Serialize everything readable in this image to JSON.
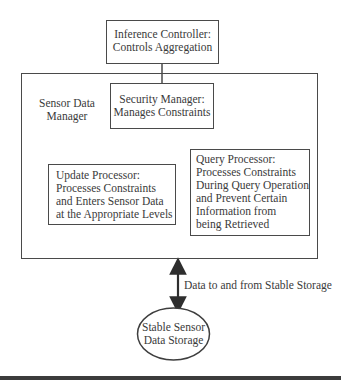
{
  "diagram": {
    "inference_controller": {
      "line1": "Inference Controller:",
      "line2": "Controls Aggregation"
    },
    "sensor_data_manager": {
      "line1": "Sensor Data",
      "line2": "Manager"
    },
    "security_manager": {
      "line1": "Security Manager:",
      "line2": "Manages Constraints"
    },
    "update_processor": {
      "lines": [
        "Update Processor:",
        "Processes Constraints",
        "and Enters Sensor Data",
        "at the Appropriate Levels"
      ]
    },
    "query_processor": {
      "lines": [
        "Query Processor:",
        "Processes Constraints",
        "During Query Operation",
        "and Prevent Certain",
        "Information from",
        "being Retrieved"
      ]
    },
    "arrow_label": "Data to and from Stable Storage",
    "stable_storage": {
      "line1": "Stable Sensor",
      "line2": "Data Storage"
    },
    "colors": {
      "stroke": "#4a4a4a",
      "text": "#3a3a3a",
      "background": "#ffffff"
    }
  }
}
